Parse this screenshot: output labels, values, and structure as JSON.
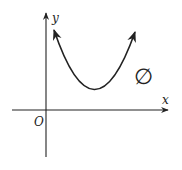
{
  "diagram": {
    "type": "function-graph",
    "axes": {
      "x_label": "x",
      "y_label": "y",
      "origin_label": "O"
    },
    "curve": {
      "shape": "parabola",
      "opens": "up",
      "vertex_quadrant": "I",
      "intersects_x_axis": false
    },
    "annotation": {
      "symbol": "∅",
      "meaning": "empty set"
    },
    "colors": {
      "stroke": "#222222",
      "background": "#ffffff"
    }
  }
}
